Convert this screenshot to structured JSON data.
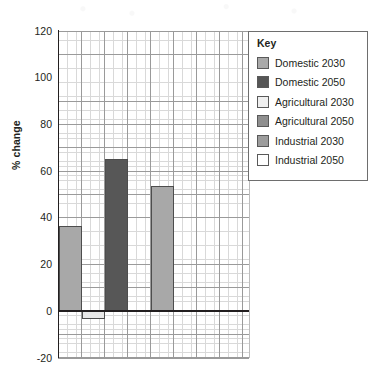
{
  "chart_data": {
    "type": "bar",
    "title": "",
    "xlabel": "",
    "ylabel": "% change",
    "ylim": [
      -20,
      120
    ],
    "ytick_labels": [
      "120",
      "100",
      "80",
      "60",
      "40",
      "20",
      "0",
      "-20"
    ],
    "ytick_values": [
      120,
      100,
      80,
      60,
      40,
      20,
      0,
      -20
    ],
    "grid": "major and minor graph paper grid",
    "legend_position": "top-right inside plot",
    "categories": [
      "Domestic 2030",
      "Domestic 2050",
      "Agricultural 2030",
      "Agricultural 2050",
      "Industrial 2030",
      "Industrial 2050"
    ],
    "values": [
      36.5,
      -3.5,
      65,
      53.5,
      null,
      null
    ],
    "bars": [
      {
        "label": "Domestic 2030",
        "value": 36.5,
        "color": "#a8a8a8",
        "slot": 0,
        "drawn": true
      },
      {
        "label": "Domestic 2050",
        "value": -3.5,
        "color": "#e8e8e8",
        "slot": 1,
        "drawn": true
      },
      {
        "label": "Agricultural 2030",
        "value": 65.0,
        "color": "#575757",
        "slot": 2,
        "drawn": true
      },
      {
        "label": "Agricultural 2050",
        "value": 53.5,
        "color": "#a8a8a8",
        "slot": 4,
        "drawn": true
      },
      {
        "label": "Industrial 2030",
        "value": null,
        "color": "#9a9a9a",
        "slot": 6,
        "drawn": false
      },
      {
        "label": "Industrial 2050",
        "value": null,
        "color": "#ffffff",
        "slot": 7,
        "drawn": false
      }
    ]
  },
  "legend": {
    "title": "Key",
    "items": [
      {
        "label": "Domestic 2030",
        "color": "#a9a9a9"
      },
      {
        "label": "Domestic 2050",
        "color": "#565656"
      },
      {
        "label": "Agricultural 2030",
        "color": "#efefef"
      },
      {
        "label": "Agricultural 2050",
        "color": "#8f8f8f"
      },
      {
        "label": "Industrial 2030",
        "color": "#9d9d9d"
      },
      {
        "label": "Industrial 2050",
        "color": "#ffffff"
      }
    ]
  },
  "colors": {
    "axis": "#231f20",
    "grid_major": "#9a9a9a",
    "grid_minor": "#d9d9d9",
    "bar_light": "#a8a8a8",
    "bar_dark": "#575757",
    "bar_pale": "#e8e8e8",
    "legend_border": "#6e6e6e",
    "background": "#ffffff"
  }
}
